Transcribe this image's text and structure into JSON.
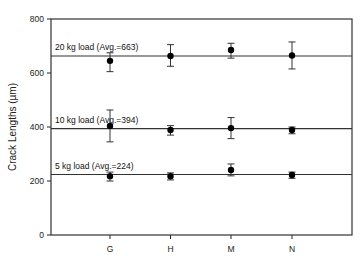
{
  "chart_data": {
    "type": "scatter",
    "title": "",
    "xlabel": "",
    "ylabel": "Crack Lengths (µm)",
    "categories": [
      "G",
      "H",
      "M",
      "N"
    ],
    "ylim": [
      0,
      800
    ],
    "yticks": [
      0,
      200,
      400,
      600,
      800
    ],
    "grid": false,
    "legend": "none",
    "series": [
      {
        "name": "20 kg load",
        "average": 663,
        "annotation": "20 kg load (Avg.=663)",
        "values": [
          645,
          663,
          685,
          665
        ],
        "err_low": [
          605,
          625,
          655,
          615
        ],
        "err_high": [
          675,
          705,
          710,
          715
        ]
      },
      {
        "name": "10 kg load",
        "average": 394,
        "annotation": "10 kg load (Avg.=394)",
        "values": [
          404,
          389,
          396,
          389
        ],
        "err_low": [
          345,
          370,
          357,
          375
        ],
        "err_high": [
          463,
          405,
          435,
          400
        ]
      },
      {
        "name": "5 kg load",
        "average": 224,
        "annotation": "5 kg load (Avg.=224)",
        "values": [
          218,
          218,
          241,
          222
        ],
        "err_low": [
          200,
          204,
          219,
          210
        ],
        "err_high": [
          233,
          230,
          263,
          233
        ]
      }
    ]
  },
  "style": {
    "axis_color": "#222222",
    "line_color": "#333333",
    "point_color": "#000000"
  }
}
